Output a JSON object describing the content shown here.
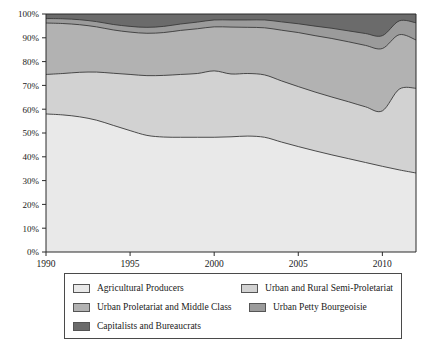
{
  "chart_data": {
    "type": "area",
    "title": "",
    "subtitle": "",
    "xlabel": "",
    "ylabel": "",
    "stacked": true,
    "normalized_percent": true,
    "grid": false,
    "legend_position": "bottom",
    "xlim": [
      1990,
      2012
    ],
    "ylim": [
      0,
      100
    ],
    "x_tick_labels": [
      "1990",
      "1995",
      "2000",
      "2005",
      "2010"
    ],
    "x_ticks": [
      1990,
      1995,
      2000,
      2005,
      2010
    ],
    "y_tick_labels": [
      "0%",
      "10%",
      "20%",
      "30%",
      "40%",
      "50%",
      "60%",
      "70%",
      "80%",
      "90%",
      "100%"
    ],
    "y_ticks": [
      0,
      10,
      20,
      30,
      40,
      50,
      60,
      70,
      80,
      90,
      100
    ],
    "x": [
      1990,
      1991,
      1992,
      1993,
      1994,
      1995,
      1996,
      1997,
      1998,
      1999,
      2000,
      2001,
      2002,
      2003,
      2004,
      2005,
      2006,
      2007,
      2008,
      2009,
      2010,
      2011,
      2012
    ],
    "series": [
      {
        "name": "Agricultural Producers",
        "color": "#e9e9e9",
        "values": [
          58.0,
          57.6,
          56.8,
          55.4,
          53.2,
          51.0,
          49.0,
          48.3,
          48.2,
          48.2,
          48.2,
          48.4,
          48.7,
          48.2,
          46.2,
          44.3,
          42.5,
          40.8,
          39.2,
          37.6,
          36.0,
          34.5,
          33.2
        ]
      },
      {
        "name": "Urban and Rural Semi-Proletariat",
        "color": "#d2d2d2",
        "values": [
          16.6,
          17.4,
          18.7,
          20.2,
          21.9,
          23.6,
          25.1,
          25.9,
          26.4,
          26.8,
          27.9,
          26.4,
          26.3,
          26.2,
          25.7,
          25.2,
          24.7,
          24.3,
          23.9,
          23.4,
          23.3,
          33.9,
          35.6
        ]
      },
      {
        "name": "Urban Proletariat and Middle Class",
        "color": "#b2b2b2",
        "values": [
          21.6,
          21.0,
          20.0,
          19.0,
          18.2,
          17.8,
          17.8,
          18.0,
          18.5,
          18.8,
          18.5,
          19.7,
          19.4,
          19.8,
          21.3,
          22.7,
          23.7,
          24.6,
          25.2,
          25.8,
          26.2,
          22.9,
          20.3
        ]
      },
      {
        "name": "Urban Petty Bourgeoisie",
        "color": "#9b9b9b",
        "values": [
          1.9,
          2.0,
          2.1,
          2.2,
          2.3,
          2.4,
          2.5,
          2.6,
          2.7,
          2.8,
          2.9,
          3.0,
          3.1,
          3.3,
          3.5,
          3.7,
          4.0,
          4.3,
          4.6,
          5.0,
          5.4,
          5.8,
          7.2
        ]
      },
      {
        "name": "Capitalists and Bureaucrats",
        "color": "#6b6b6b",
        "values": [
          1.9,
          2.0,
          2.4,
          3.2,
          4.4,
          5.2,
          5.6,
          5.2,
          4.2,
          3.4,
          2.5,
          2.5,
          2.5,
          2.5,
          3.3,
          4.1,
          5.1,
          6.0,
          7.1,
          8.2,
          9.1,
          2.9,
          3.7
        ]
      }
    ]
  },
  "legend": {
    "entries": [
      {
        "label": "Agricultural Producers",
        "color": "#e9e9e9"
      },
      {
        "label": "Urban and Rural Semi-Proletariat",
        "color": "#d2d2d2"
      },
      {
        "label": "Urban Proletariat and Middle Class",
        "color": "#b2b2b2"
      },
      {
        "label": "Urban Petty Bourgeoisie",
        "color": "#9b9b9b"
      },
      {
        "label": "Capitalists and Bureaucrats",
        "color": "#6b6b6b"
      }
    ]
  }
}
